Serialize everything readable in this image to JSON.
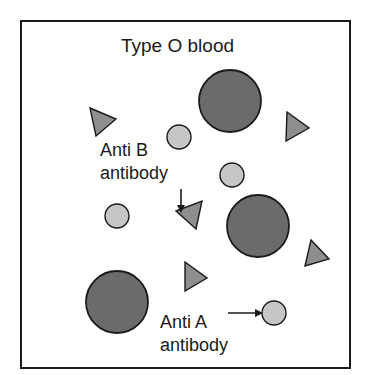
{
  "diagram": {
    "title": "Type O blood",
    "labels": {
      "anti_b_line1": "Anti B",
      "anti_b_line2": "antibody",
      "anti_a_line1": "Anti A",
      "anti_a_line2": "antibody"
    },
    "colors": {
      "border": "#1a1a1a",
      "red_cell_fill": "#6b6b6b",
      "anti_a_fill": "#c6c6c6",
      "anti_b_fill": "#8e8e8e",
      "stroke": "#1a1a1a"
    },
    "elements": {
      "red_blood_cells": [
        {
          "cx": 230,
          "cy": 101,
          "r": 31
        },
        {
          "cx": 258,
          "cy": 226,
          "r": 31
        },
        {
          "cx": 117,
          "cy": 302,
          "r": 31
        }
      ],
      "anti_a_antibodies_circles": [
        {
          "cx": 179,
          "cy": 137,
          "r": 12
        },
        {
          "cx": 232,
          "cy": 175,
          "r": 12
        },
        {
          "cx": 117,
          "cy": 216,
          "r": 12
        },
        {
          "cx": 274,
          "cy": 313,
          "r": 12
        }
      ],
      "anti_b_antibodies_triangles": [
        {
          "points": "90,108 116,119 96,136"
        },
        {
          "points": "287,112 309,128 286,141"
        },
        {
          "points": "176,211 202,201 196,229"
        },
        {
          "points": "311,240 329,259 305,266"
        },
        {
          "points": "185,262 207,278 185,291"
        }
      ]
    }
  }
}
